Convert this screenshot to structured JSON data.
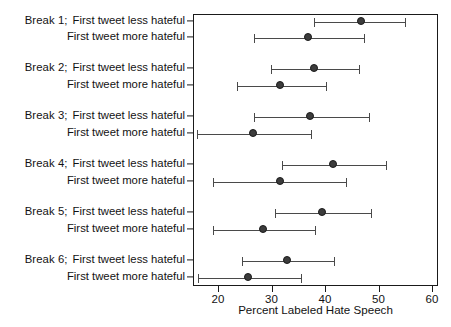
{
  "chart_data": {
    "type": "scatter",
    "orientation": "horizontal",
    "title": "",
    "xlabel": "Percent Labeled Hate Speech",
    "ylabel": "",
    "xlim": [
      15,
      62
    ],
    "xticks": [
      20,
      30,
      40,
      50,
      60
    ],
    "xticklabels": [
      "20",
      "30",
      "40",
      "50",
      "60"
    ],
    "grid": false,
    "legend": null,
    "marker": "filled-circle",
    "error_bars": "horizontal-capped",
    "categories": [
      "Break 1;  First tweet less hateful",
      "First tweet more hateful",
      "Break 2;  First tweet less hateful",
      "First tweet more hateful",
      "Break 3;  First tweet less hateful",
      "First tweet more hateful",
      "Break 4;  First tweet less hateful",
      "First tweet more hateful",
      "Break 5;  First tweet less hateful",
      "First tweet more hateful",
      "Break 6;  First tweet less hateful",
      "First tweet more hateful"
    ],
    "points": [
      {
        "group": "Break 1",
        "condition": "First tweet less hateful",
        "value": 46.7,
        "low": 37.8,
        "high": 54.8
      },
      {
        "group": "Break 1",
        "condition": "First tweet more hateful",
        "value": 36.8,
        "low": 26.5,
        "high": 47.1
      },
      {
        "group": "Break 2",
        "condition": "First tweet less hateful",
        "value": 37.9,
        "low": 29.7,
        "high": 46.2
      },
      {
        "group": "Break 2",
        "condition": "First tweet more hateful",
        "value": 31.6,
        "low": 23.4,
        "high": 40.0
      },
      {
        "group": "Break 3",
        "condition": "First tweet less hateful",
        "value": 37.2,
        "low": 26.5,
        "high": 48.0
      },
      {
        "group": "Break 3",
        "condition": "First tweet more hateful",
        "value": 26.5,
        "low": 15.8,
        "high": 37.2
      },
      {
        "group": "Break 4",
        "condition": "First tweet less hateful",
        "value": 41.5,
        "low": 31.8,
        "high": 51.2
      },
      {
        "group": "Break 4",
        "condition": "First tweet more hateful",
        "value": 31.6,
        "low": 18.9,
        "high": 43.7
      },
      {
        "group": "Break 5",
        "condition": "First tweet less hateful",
        "value": 39.4,
        "low": 30.5,
        "high": 48.4
      },
      {
        "group": "Break 5",
        "condition": "First tweet more hateful",
        "value": 28.4,
        "low": 18.9,
        "high": 37.9
      },
      {
        "group": "Break 6",
        "condition": "First tweet less hateful",
        "value": 32.9,
        "low": 24.3,
        "high": 41.5
      },
      {
        "group": "Break 6",
        "condition": "First tweet more hateful",
        "value": 25.6,
        "low": 16.0,
        "high": 35.3
      }
    ],
    "row_labels": [
      {
        "prefix": "Break 1;",
        "text": "First tweet less hateful"
      },
      {
        "prefix": "",
        "text": "First tweet more hateful"
      },
      {
        "prefix": "Break 2;",
        "text": "First tweet less hateful"
      },
      {
        "prefix": "",
        "text": "First tweet more hateful"
      },
      {
        "prefix": "Break 3;",
        "text": "First tweet less hateful"
      },
      {
        "prefix": "",
        "text": "First tweet more hateful"
      },
      {
        "prefix": "Break 4;",
        "text": "First tweet less hateful"
      },
      {
        "prefix": "",
        "text": "First tweet more hateful"
      },
      {
        "prefix": "Break 5;",
        "text": "First tweet less hateful"
      },
      {
        "prefix": "",
        "text": "First tweet more hateful"
      },
      {
        "prefix": "Break 6;",
        "text": "First tweet less hateful"
      },
      {
        "prefix": "",
        "text": "First tweet more hateful"
      }
    ],
    "colors": {
      "marker": "#3c3c3c",
      "marker_edge": "#1b1b1b",
      "error_bar": "#4a4a4a",
      "axis": "#1a1a1a",
      "text": "#121212",
      "background": "#ffffff"
    }
  }
}
